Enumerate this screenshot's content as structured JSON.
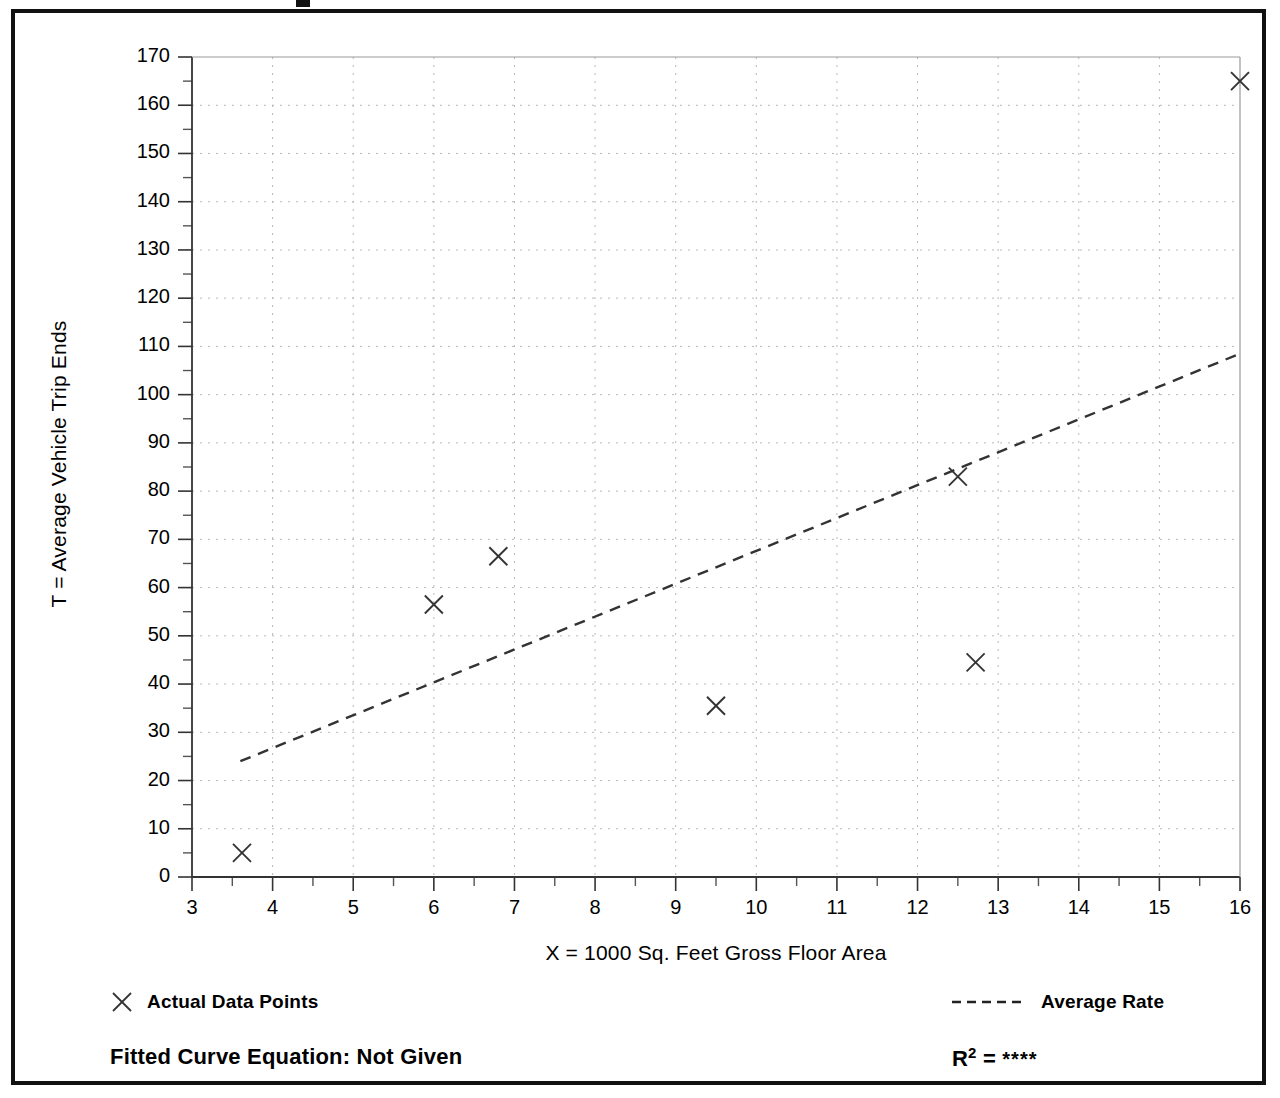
{
  "chart_data": {
    "type": "scatter",
    "title": "",
    "xlabel": "X = 1000 Sq. Feet Gross Floor Area",
    "ylabel": "T = Average Vehicle Trip Ends",
    "xlim": [
      3,
      16
    ],
    "ylim": [
      0,
      170
    ],
    "xticks": [
      3,
      4,
      5,
      6,
      7,
      8,
      9,
      10,
      11,
      12,
      13,
      14,
      15,
      16
    ],
    "yticks": [
      0,
      10,
      20,
      30,
      40,
      50,
      60,
      70,
      80,
      90,
      100,
      110,
      120,
      130,
      140,
      150,
      160,
      170
    ],
    "xtick_labels": [
      "3",
      "4",
      "5",
      "6",
      "7",
      "8",
      "9",
      "10",
      "11",
      "12",
      "13",
      "14",
      "15",
      "16"
    ],
    "ytick_labels": [
      "0",
      "10",
      "20",
      "30",
      "40",
      "50",
      "60",
      "70",
      "80",
      "90",
      "100",
      "110",
      "120",
      "130",
      "140",
      "150",
      "160",
      "170"
    ],
    "x_minor_step": 0.5,
    "y_minor_step": 5,
    "grid": true,
    "grid_style": "dotted",
    "grid_color": "#b8b8b8",
    "legend_position": "below-plot",
    "series": [
      {
        "name": "Actual Data Points",
        "type": "scatter",
        "marker": "x",
        "color": "#333333",
        "points": [
          {
            "x": 3.62,
            "y": 5.0
          },
          {
            "x": 6.0,
            "y": 56.5
          },
          {
            "x": 6.8,
            "y": 66.5
          },
          {
            "x": 9.5,
            "y": 35.5
          },
          {
            "x": 12.5,
            "y": 83.0
          },
          {
            "x": 12.72,
            "y": 44.5
          },
          {
            "x": 16.0,
            "y": 165.0
          }
        ]
      },
      {
        "name": "Average Rate",
        "type": "line",
        "style": "dashed",
        "color": "#333333",
        "endpoints": [
          {
            "x": 3.6,
            "y": 24.0
          },
          {
            "x": 16.0,
            "y": 108.5
          }
        ]
      }
    ]
  },
  "axes": {
    "x_title": "X = 1000 Sq. Feet Gross Floor Area",
    "y_title": "T = Average Vehicle Trip Ends"
  },
  "legend": {
    "actual_marker": "x-marker-icon",
    "actual_label": "Actual Data Points",
    "rate_marker": "dashed-line-icon",
    "rate_label": "Average Rate"
  },
  "footer": {
    "fitted_equation_label": "Fitted Curve Equation:  Not Given",
    "r_squared_prefix": "R",
    "r_squared_exponent": "2",
    "r_squared_equals": " = ",
    "r_squared_value": "****"
  }
}
